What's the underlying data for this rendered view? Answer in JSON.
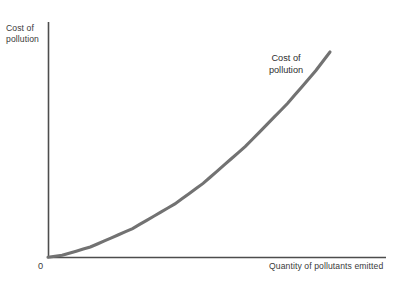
{
  "chart_data": {
    "type": "line",
    "title": "",
    "subtitle": "",
    "xlabel": "Quantity of pollutants emitted",
    "ylabel": "Cost of pollution",
    "origin_label": "0",
    "grid": false,
    "legend_position": "none",
    "axis_color": "#4d4d4d",
    "curve_color": "#727272",
    "text_color": "#3a3a3a",
    "background": "#ffffff",
    "xlim": [
      0,
      1
    ],
    "ylim": [
      0,
      1
    ],
    "annotations": [
      {
        "name": "cost-of-pollution-curve-label",
        "text": "Cost of\npollution",
        "x": 0.72,
        "y": 0.82
      }
    ],
    "series": [
      {
        "name": "Cost of pollution",
        "shape": "convex-increasing",
        "description": "Marginal social cost of pollution rising at an increasing rate from the origin",
        "x": [
          0.0,
          0.05,
          0.1,
          0.15,
          0.2,
          0.25,
          0.3,
          0.35,
          0.4,
          0.45,
          0.5,
          0.55,
          0.6,
          0.65,
          0.7,
          0.75,
          0.8,
          0.85,
          0.9,
          0.95,
          1.0
        ],
        "y": [
          0.0,
          0.01,
          0.03,
          0.05,
          0.08,
          0.11,
          0.14,
          0.18,
          0.22,
          0.26,
          0.31,
          0.36,
          0.42,
          0.48,
          0.54,
          0.61,
          0.68,
          0.75,
          0.83,
          0.91,
          1.0
        ]
      }
    ]
  }
}
